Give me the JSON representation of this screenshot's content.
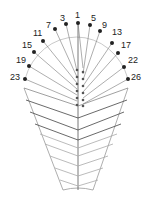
{
  "diagram": {
    "type": "electrode-head-map",
    "points": [
      {
        "label": "1",
        "x": 78,
        "y": 23,
        "lx": 75,
        "ly": 11
      },
      {
        "label": "3",
        "x": 66,
        "y": 24,
        "lx": 60,
        "ly": 14
      },
      {
        "label": "5",
        "x": 90,
        "y": 25,
        "lx": 91,
        "ly": 14
      },
      {
        "label": "7",
        "x": 55,
        "y": 29,
        "lx": 46,
        "ly": 21
      },
      {
        "label": "9",
        "x": 100,
        "y": 31,
        "lx": 102,
        "ly": 21
      },
      {
        "label": "11",
        "x": 43,
        "y": 41,
        "lx": 33,
        "ly": 29
      },
      {
        "label": "13",
        "x": 112,
        "y": 43,
        "lx": 112,
        "ly": 28
      },
      {
        "label": "15",
        "x": 34,
        "y": 52,
        "lx": 22,
        "ly": 41
      },
      {
        "label": "17",
        "x": 118,
        "y": 53,
        "lx": 121,
        "ly": 41
      },
      {
        "label": "19",
        "x": 29,
        "y": 66,
        "lx": 16,
        "ly": 56
      },
      {
        "label": "22",
        "x": 124,
        "y": 67,
        "lx": 128,
        "ly": 56
      },
      {
        "label": "23",
        "x": 25,
        "y": 79,
        "lx": 10,
        "ly": 73
      },
      {
        "label": "26",
        "x": 128,
        "y": 79,
        "lx": 131,
        "ly": 73
      }
    ],
    "colors": {
      "dot": "#222222",
      "line_dark": "#444444",
      "line_light": "#aaaaaa",
      "outline": "#888888"
    }
  }
}
